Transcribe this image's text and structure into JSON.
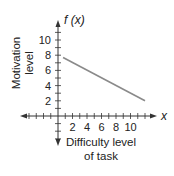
{
  "chart_data": {
    "type": "line",
    "title": "",
    "function_label": "f (x)",
    "xlabel": "Difficulty level of task",
    "xlabel_lines": [
      "Difficulty level",
      "of task"
    ],
    "ylabel": "Motivation level",
    "ylabel_lines": [
      "Motivation",
      "level"
    ],
    "x_axis_symbol": "x",
    "x_ticks": [
      2,
      4,
      6,
      8,
      10
    ],
    "y_ticks": [
      2,
      4,
      6,
      8,
      10
    ],
    "xlim": [
      -3,
      13
    ],
    "ylim": [
      -3,
      11
    ],
    "grid": false,
    "legend": null,
    "series": [
      {
        "name": "f(x)",
        "color": "#8a8a8a",
        "points": [
          [
            0.7,
            7.7
          ],
          [
            12,
            2
          ]
        ]
      }
    ]
  }
}
